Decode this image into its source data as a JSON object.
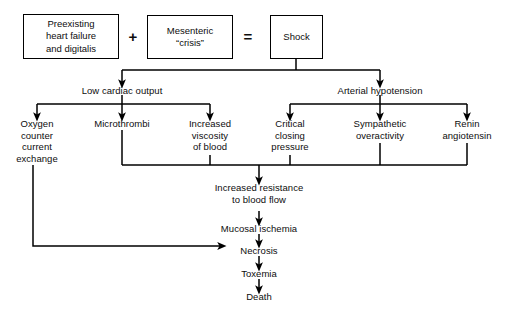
{
  "diagram": {
    "background_color": "#ffffff",
    "line_color": "#000000",
    "text_color": "#0d0d0d",
    "equation": {
      "term1": "Preexisting\nheart failure\nand digitalis",
      "plus": "+",
      "term2": "Mesenteric\n“crisis”",
      "equals": "=",
      "result": "Shock"
    },
    "branches": {
      "left": "Low cardiac output",
      "right": "Arterial hypotension"
    },
    "left_children": [
      "Oxygen\ncounter\ncurrent\nexchange",
      "Microthrombi",
      "Increased\nviscosity\nof blood"
    ],
    "right_children": [
      "Critical\nclosing\npressure",
      "Sympathetic\noveractivity",
      "Renin\nangiotensin"
    ],
    "chain": [
      "Increased resistance\nto blood flow",
      "Mucosal ischemia",
      "Necrosis",
      "Toxemia",
      "Death"
    ]
  }
}
